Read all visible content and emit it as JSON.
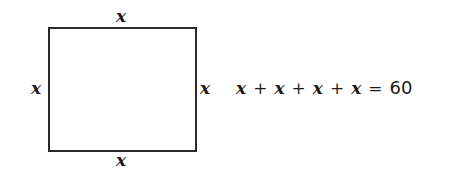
{
  "diagram": {
    "shape": "square",
    "side_labels": {
      "top": "x",
      "bottom": "x",
      "left": "x",
      "right": "x"
    },
    "equation": {
      "terms": [
        "x",
        "x",
        "x",
        "x"
      ],
      "plus": "+",
      "equals": "=",
      "result": "60"
    }
  }
}
